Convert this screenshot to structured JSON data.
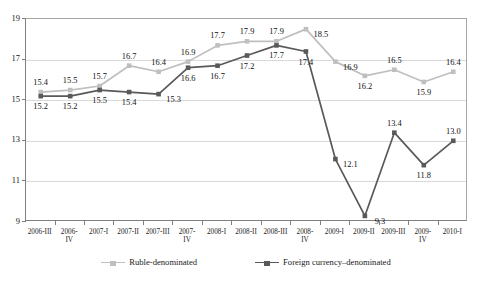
{
  "chart_data": {
    "type": "line",
    "title": "",
    "subtitle": "",
    "xlabel": "",
    "ylabel": "",
    "ylim": [
      9,
      19
    ],
    "yticks": [
      9,
      11,
      13,
      15,
      17,
      19
    ],
    "grid": true,
    "legend_position": "bottom",
    "categories": [
      "2006-III",
      "2006-\nIV",
      "2007-I",
      "2007-II",
      "2007-III",
      "2007-\nIV",
      "2008-I",
      "2008-II",
      "2008-III",
      "2008-\nIV",
      "2009-I",
      "2009-II",
      "2009-III",
      "2009-\nIV",
      "2010-I"
    ],
    "series": [
      {
        "name": "Ruble-denominated",
        "color": "#BFBFBF",
        "marker": "square",
        "values": [
          15.4,
          15.5,
          15.7,
          16.7,
          16.4,
          16.9,
          17.7,
          17.9,
          17.9,
          18.5,
          16.9,
          16.2,
          16.5,
          15.9,
          16.4
        ],
        "labels": [
          "15.4",
          "15.5",
          "15.7",
          "16.7",
          "16.4",
          "16.9",
          "17.7",
          "17.9",
          "17.9",
          "18.5",
          "16.9",
          "16.2",
          "16.5",
          "15.9",
          "16.4"
        ],
        "label_positions": [
          "above",
          "above",
          "above",
          "above",
          "above",
          "above",
          "above",
          "above",
          "above",
          "right",
          "right",
          "below",
          "above",
          "below",
          "above"
        ]
      },
      {
        "name": "Foreign currency–denominated",
        "color": "#595959",
        "marker": "square",
        "values": [
          15.2,
          15.2,
          15.5,
          15.4,
          15.3,
          16.6,
          16.7,
          17.2,
          17.7,
          17.4,
          12.1,
          9.3,
          13.4,
          11.8,
          13.0
        ],
        "labels": [
          "15.2",
          "15.2",
          "15.5",
          "15.4",
          "15.3",
          "16.6",
          "16.7",
          "17.2",
          "17.7",
          "17.4",
          "12.1",
          "9.3",
          "13.4",
          "11.8",
          "13.0"
        ],
        "label_positions": [
          "below",
          "below",
          "below",
          "below",
          "right",
          "below",
          "below",
          "below",
          "below",
          "below",
          "right",
          "right",
          "above",
          "below",
          "above"
        ]
      }
    ]
  },
  "legend": {
    "items": [
      {
        "label": "Ruble-denominated",
        "color": "#BFBFBF"
      },
      {
        "label": "Foreign currency–denominated",
        "color": "#595959"
      }
    ]
  },
  "axis": {
    "y_tick_labels": [
      "19",
      "17",
      "15",
      "13",
      "11",
      "9"
    ]
  }
}
